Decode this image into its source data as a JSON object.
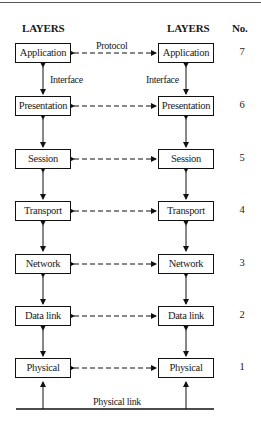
{
  "diagram": {
    "title_left": "LAYERS",
    "title_right": "LAYERS",
    "title_number": "No.",
    "protocol_label": "Protocol",
    "interface_label_left": "Interface",
    "interface_label_right": "Interface",
    "physical_link_label": "Physical link",
    "layers": [
      {
        "name": "Application",
        "number": "7"
      },
      {
        "name": "Presentation",
        "number": "6"
      },
      {
        "name": "Session",
        "number": "5"
      },
      {
        "name": "Transport",
        "number": "4"
      },
      {
        "name": "Network",
        "number": "3"
      },
      {
        "name": "Data link",
        "number": "2"
      },
      {
        "name": "Physical",
        "number": "1"
      }
    ],
    "colors": {
      "line": "#111111",
      "background": "#ffffff"
    }
  }
}
